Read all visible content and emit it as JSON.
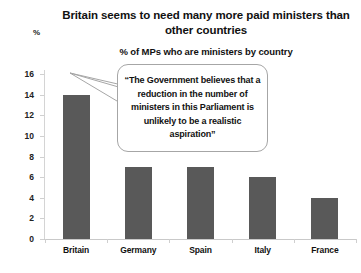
{
  "chart_data": {
    "type": "bar",
    "title": "Britain seems to need many more paid ministers than other countries",
    "subtitle": "% of MPs who are ministers by country",
    "categories": [
      "Britain",
      "Germany",
      "Spain",
      "Italy",
      "France"
    ],
    "values": [
      14,
      7,
      7,
      6,
      4
    ],
    "xlabel": "",
    "ylabel": "%",
    "ylim": [
      0,
      16
    ],
    "ytick_values": [
      16,
      14,
      12,
      10,
      8,
      6,
      4,
      2,
      0
    ],
    "grid": false,
    "legend": "none",
    "series": [
      {
        "name": "% of MPs who are ministers",
        "values": [
          14,
          7,
          7,
          6,
          4
        ]
      }
    ],
    "annotations": [
      {
        "text": "“The Government believes that a reduction in the number of ministers in this Parliament is unlikely to be a realistic aspiration”",
        "points_at": "Britain",
        "style": "speech-bubble"
      }
    ],
    "colors": {
      "bar_fill": "#595959",
      "background": "#ffffff",
      "axis_line": "#cfcfcf",
      "callout_border": "#a6a6a6",
      "text": "#111111"
    }
  }
}
